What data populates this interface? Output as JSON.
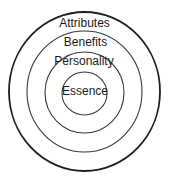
{
  "diagram": {
    "type": "concentric-circles",
    "center": {
      "x": 84.5,
      "y": 92
    },
    "rings": [
      {
        "label": "Attributes",
        "rx": 75.5,
        "ry": 79.5,
        "stroke": "#1e1e1e",
        "stroke_width": 1.8,
        "label_y": 27
      },
      {
        "label": "Benefits",
        "rx": 57.5,
        "ry": 60.5,
        "stroke": "#3a3a3a",
        "stroke_width": 1.1,
        "label_y": 46
      },
      {
        "label": "Personality",
        "rx": 39.5,
        "ry": 40.5,
        "stroke": "#3a3a3a",
        "stroke_width": 1.1,
        "label_y": 65
      },
      {
        "label": "Essence",
        "rx": 22.5,
        "ry": 21.5,
        "stroke": "#3a3a3a",
        "stroke_width": 1.1,
        "label_y": 95
      }
    ]
  }
}
